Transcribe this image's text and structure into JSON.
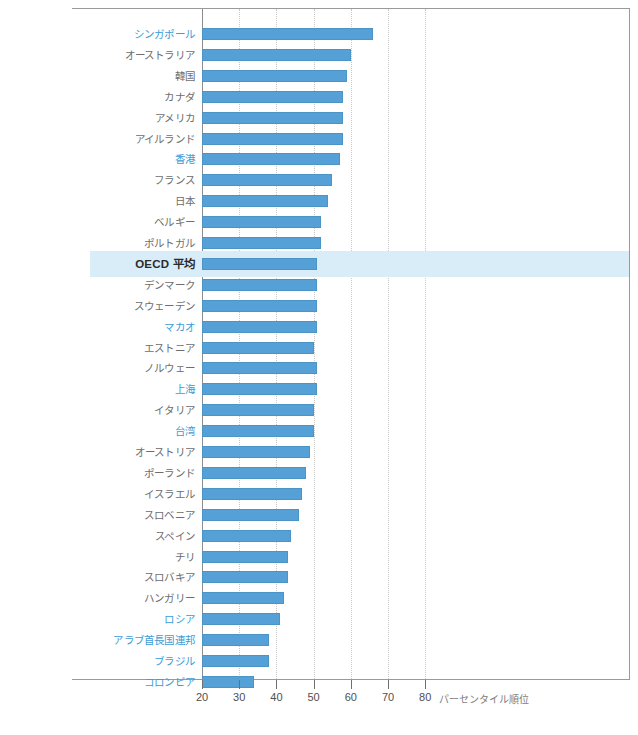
{
  "chart_data": {
    "type": "bar",
    "orientation": "horizontal",
    "title": "",
    "subtitle": "",
    "xlabel": "パーセンタイル順位",
    "ylabel": "",
    "xlim": [
      20,
      84
    ],
    "xticks": [
      20,
      30,
      40,
      50,
      60,
      70,
      80
    ],
    "xtick_labels": [
      "20",
      "30",
      "40",
      "50",
      "60",
      "70",
      "80"
    ],
    "grid": true,
    "legend": "none",
    "bar_color": "#55a0d6",
    "highlight_color": "#d8edf8",
    "accent_label_color": "#3d9bd6",
    "categories": [
      "シンガポール",
      "オーストラリア",
      "韓国",
      "カナダ",
      "アメリカ",
      "アイルランド",
      "香港",
      "フランス",
      "日本",
      "ベルギー",
      "ポルトガル",
      "OECD 平均",
      "デンマーク",
      "スウェーデン",
      "マカオ",
      "エストニア",
      "ノルウェー",
      "上海",
      "イタリア",
      "台湾",
      "オーストリア",
      "ポーランド",
      "イスラエル",
      "スロベニア",
      "スペイン",
      "チリ",
      "スロバキア",
      "ハンガリー",
      "ロシア",
      "アラブ首長国連邦",
      "ブラジル",
      "コロンビア"
    ],
    "values": [
      66,
      60,
      59,
      58,
      58,
      58,
      57,
      55,
      54,
      52,
      52,
      51,
      51,
      51,
      51,
      50,
      51,
      51,
      50,
      50,
      49,
      48,
      47,
      46,
      44,
      43,
      43,
      42,
      41,
      38,
      38,
      34
    ],
    "label_styles": [
      "accent",
      "normal",
      "normal",
      "normal",
      "normal",
      "normal",
      "accent",
      "normal",
      "normal",
      "normal",
      "normal",
      "emphasis",
      "normal",
      "normal",
      "accent",
      "normal",
      "normal",
      "accent",
      "normal",
      "accent",
      "normal",
      "normal",
      "normal",
      "normal",
      "normal",
      "normal",
      "normal",
      "normal",
      "accent",
      "accent",
      "accent",
      "accent"
    ],
    "highlight_index": 11
  }
}
